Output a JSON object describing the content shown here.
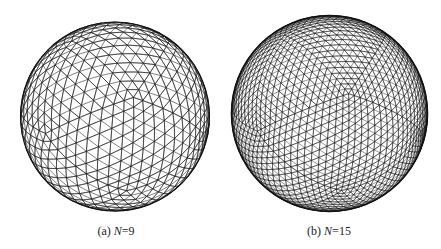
{
  "figure": {
    "panels": [
      {
        "id": "a",
        "label": "(a)",
        "variable": "N",
        "equals": "=",
        "value": "9",
        "mesh": {
          "cx": 115,
          "cy": 116.5,
          "r": 94.5,
          "subdivisions": 9,
          "stroke": "#1a1a1a"
        },
        "caption_pos": {
          "x": 116,
          "y": 224
        }
      },
      {
        "id": "b",
        "label": "(b)",
        "variable": "N",
        "equals": "=",
        "value": "15",
        "mesh": {
          "cx": 329.5,
          "cy": 113.5,
          "r": 98,
          "subdivisions": 15,
          "stroke": "#111111"
        },
        "caption_pos": {
          "x": 329,
          "y": 224
        }
      }
    ]
  }
}
